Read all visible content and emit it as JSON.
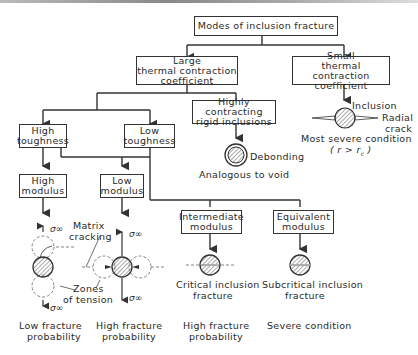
{
  "title": "Modes of inclusion fracture",
  "boxes": {
    "large": [
      "Large",
      "thermal contraction",
      "coefficient"
    ],
    "small": [
      "Small",
      "thermal contraction",
      "coefficient"
    ],
    "rigid": [
      "Highly contracting",
      "rigid inclusions"
    ],
    "high_tough": [
      "High",
      "toughness"
    ],
    "low_tough": [
      "Low",
      "toughness"
    ],
    "high_mod": [
      "High",
      "modulus"
    ],
    "low_mod": [
      "Low",
      "modulus"
    ],
    "inter_mod": [
      "Intermediate",
      "modulus"
    ],
    "equiv_mod": [
      "Equivalent",
      "modulus"
    ]
  },
  "annotations": {
    "inclusion": "Inclusion",
    "radial_crack": [
      "Radial",
      "crack"
    ],
    "most_severe": "Most severe condition",
    "condition": "( r > r",
    "condition_sub": "c",
    "condition_close": " )",
    "debonding": "Debonding",
    "void": "Analogous to void",
    "matrix_cracking": [
      "Matrix",
      "cracking"
    ],
    "zones_tension": [
      "Zones",
      "of tension"
    ],
    "sigma": "σ∞",
    "critical": [
      "Critical inclusion",
      "fracture"
    ],
    "subcritical": [
      "Subcritical inclusion",
      "fracture"
    ]
  },
  "outcomes": {
    "low_frac": [
      "Low fracture",
      "probability"
    ],
    "high_frac_1": [
      "High fracture",
      "probability"
    ],
    "high_frac_2": [
      "High fracture",
      "probability"
    ],
    "severe": "Severe condition"
  },
  "colors": {
    "line": "#333333",
    "hatch": "#555555",
    "dash": "#777777"
  }
}
